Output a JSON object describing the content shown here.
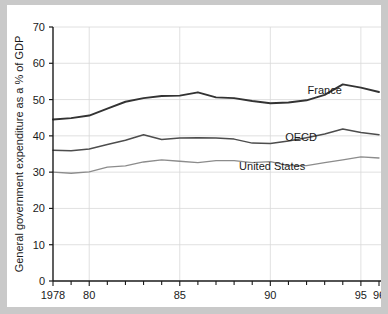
{
  "chart_data": {
    "type": "line",
    "title": "",
    "xlabel": "",
    "ylabel": "General government expenditure as a % of GDP",
    "xlim": [
      1978,
      1996
    ],
    "ylim": [
      0,
      70
    ],
    "ytick_values": [
      0,
      10,
      20,
      30,
      40,
      50,
      60,
      70
    ],
    "ytick_labels": [
      "0",
      "10",
      "20",
      "30",
      "40",
      "50",
      "60",
      "70"
    ],
    "xtick_values": [
      1978,
      1980,
      1985,
      1990,
      1995,
      1996
    ],
    "xtick_labels": [
      "1978",
      "80",
      "85",
      "90",
      "95",
      "96"
    ],
    "x_minor_ticks_every": 1,
    "grid": "xy-major-light",
    "gridlines_x": [
      1980,
      1985,
      1990,
      1995
    ],
    "gridlines_y": [
      10,
      20,
      30,
      40,
      50,
      60,
      70
    ],
    "legend_position": "inline-labels",
    "x": [
      1978,
      1979,
      1980,
      1981,
      1982,
      1983,
      1984,
      1985,
      1986,
      1987,
      1988,
      1989,
      1990,
      1991,
      1992,
      1993,
      1994,
      1995,
      1996
    ],
    "series": [
      {
        "name": "France",
        "color": "#333333",
        "width": 1.9,
        "label_x": 1993.0,
        "label_y": 51.6,
        "values": [
          44.5,
          44.9,
          45.6,
          47.5,
          49.4,
          50.4,
          51.0,
          51.1,
          52.0,
          50.6,
          50.4,
          49.6,
          49.0,
          49.2,
          49.8,
          51.3,
          54.2,
          53.3,
          52.1
        ]
      },
      {
        "name": "OECD",
        "color": "#4d4d4d",
        "width": 1.5,
        "label_x": 1991.7,
        "label_y": 38.5,
        "values": [
          36.0,
          35.9,
          36.4,
          37.6,
          38.8,
          40.3,
          39.0,
          39.4,
          39.5,
          39.4,
          39.1,
          38.0,
          37.9,
          38.6,
          39.5,
          40.5,
          41.9,
          40.9,
          40.3
        ]
      },
      {
        "name": "United States",
        "color": "#8c8c8c",
        "width": 1.3,
        "label_x": 1990.1,
        "label_y": 30.5,
        "values": [
          30.0,
          29.7,
          30.1,
          31.4,
          31.7,
          32.8,
          33.4,
          33.0,
          32.6,
          33.2,
          33.2,
          32.6,
          32.9,
          31.8,
          31.8,
          32.6,
          33.4,
          34.2,
          33.9
        ]
      }
    ],
    "series_tail": {
      "United States": [
        33.9,
        32.9,
        32.5,
        32.4
      ]
    }
  },
  "layout": {
    "plot_left": 46,
    "plot_right": 372,
    "plot_top": 22,
    "plot_bottom": 276
  }
}
